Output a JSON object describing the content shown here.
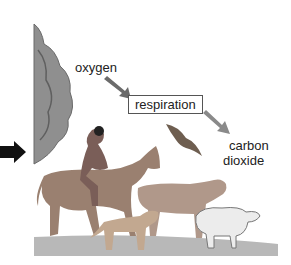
{
  "figure": {
    "labels": {
      "input": "oxygen",
      "process": "respiration",
      "output_line1": "carbon",
      "output_line2": "dioxide"
    },
    "colors": {
      "arrow_in": "#6b6b6b",
      "arrow_out": "#8a8a8a",
      "pointer_arrow": "#111111",
      "ground": "#b5b5b5",
      "tree": "#8c8c8c"
    },
    "scene": [
      "tree",
      "horse-with-rider",
      "bird",
      "cow",
      "dog",
      "sheep"
    ]
  }
}
